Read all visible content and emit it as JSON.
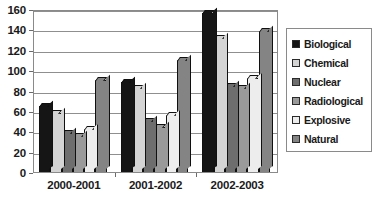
{
  "chart_data": {
    "type": "bar",
    "title": "",
    "subtitle": "",
    "xlabel": "",
    "ylabel": "",
    "ylim": [
      0,
      160
    ],
    "ytick_step": 20,
    "yticks": [
      "0",
      "20",
      "40",
      "60",
      "80",
      "100",
      "120",
      "140",
      "160"
    ],
    "grid": true,
    "grid_axis": "y",
    "legend_position": "right",
    "categories": [
      "2000-2001",
      "2001-2002",
      "2002-2003"
    ],
    "series": [
      {
        "name": "Biological",
        "color": "#151515",
        "values": [
          65,
          88,
          156
        ]
      },
      {
        "name": "Chemical",
        "color": "#d4d4d4",
        "values": [
          58,
          82,
          132
        ]
      },
      {
        "name": "Nuclear",
        "color": "#6e6e6e",
        "values": [
          38,
          50,
          84
        ]
      },
      {
        "name": "Radiological",
        "color": "#9a9a9a",
        "values": [
          35,
          44,
          82
        ]
      },
      {
        "name": "Explosive",
        "color": "#ededed",
        "values": [
          42,
          56,
          92
        ]
      },
      {
        "name": "Natural",
        "color": "#848484",
        "values": [
          90,
          110,
          138
        ]
      }
    ]
  },
  "legend": {
    "items": [
      {
        "label": "Biological"
      },
      {
        "label": "Chemical"
      },
      {
        "label": "Nuclear"
      },
      {
        "label": "Radiological"
      },
      {
        "label": "Explosive"
      },
      {
        "label": "Natural"
      }
    ]
  },
  "caption": {
    "text": ""
  }
}
